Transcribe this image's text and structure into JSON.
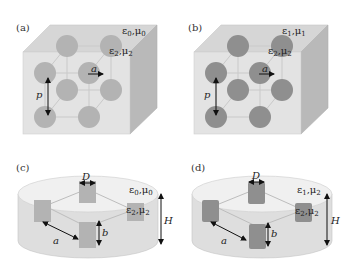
{
  "figure": {
    "panels": [
      {
        "id": "a",
        "label": "(a)",
        "shape": "cube-lattice",
        "host_medium": {
          "eps": "ε",
          "eps_sub": "0",
          "mu": "μ",
          "mu_sub": "0"
        },
        "inclusion_medium": {
          "eps": "ε",
          "eps_sub": "2",
          "mu": "μ",
          "mu_sub": "2"
        },
        "dimension_labels": {
          "lattice_constant": "a",
          "period": "p"
        },
        "sphere_color": "#b3b3b3"
      },
      {
        "id": "b",
        "label": "(b)",
        "shape": "cube-lattice",
        "host_medium": {
          "eps": "ε",
          "eps_sub": "1",
          "mu": "μ",
          "mu_sub": "1"
        },
        "inclusion_medium": {
          "eps": "ε",
          "eps_sub": "2",
          "mu": "μ",
          "mu_sub": "2"
        },
        "dimension_labels": {
          "lattice_constant": "a",
          "period": "p"
        },
        "sphere_color": "#8f8f8f"
      },
      {
        "id": "c",
        "label": "(c)",
        "shape": "disk-cylinders",
        "host_medium": {
          "eps": "ε",
          "eps_sub": "0",
          "mu": "μ",
          "mu_sub": "0"
        },
        "inclusion_medium": {
          "eps": "ε",
          "eps_sub": "2",
          "mu": "μ",
          "mu_sub": "2"
        },
        "dimension_labels": {
          "diameter": "D",
          "height": "H",
          "cyl_height": "b",
          "spacing": "a"
        },
        "cylinder_color": "#b3b3b3"
      },
      {
        "id": "d",
        "label": "(d)",
        "shape": "disk-cylinders",
        "host_medium": {
          "eps": "ε",
          "eps_sub": "1",
          "mu": "μ",
          "mu_sub": "2"
        },
        "inclusion_medium": {
          "eps": "ε",
          "eps_sub": "2",
          "mu": "μ",
          "mu_sub": "2"
        },
        "dimension_labels": {
          "diameter": "D",
          "height": "H",
          "cyl_height": "b",
          "spacing": "a"
        },
        "cylinder_color": "#8f8f8f"
      }
    ],
    "colors": {
      "box_front": "#e3e3e3",
      "box_top": "#d6d6d6",
      "box_side": "#b9b9b9",
      "lattice_line": "#cfcfcf",
      "arrow": "#111111"
    }
  }
}
